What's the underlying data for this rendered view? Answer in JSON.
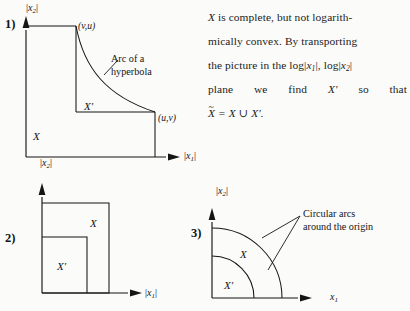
{
  "figure": {
    "caption_text": {
      "lines": [
        "X is complete, but not logarith-",
        "mically convex. By transporting",
        "the picture in the log|x1|, log|x2|",
        "plane we find X' so that",
        "X~ = X ∪ X'."
      ],
      "line1_pre": "X",
      "line1_post": " is complete, but not logarith-",
      "line2": "mically convex. By transporting",
      "line3_a": "the picture in the log|",
      "line3_x1": "x",
      "line3_x1sub": "1",
      "line3_b": "|, log|",
      "line3_x2": "x",
      "line3_x2sub": "2",
      "line3_c": "|",
      "line4_words": [
        "plane",
        "we",
        "find",
        "X′",
        "so",
        "that"
      ],
      "line5_xtilde": "X",
      "line5_rest": " = X ∪ X′."
    },
    "panels": [
      {
        "number": "1)",
        "y_axis_label_abs_open": "|",
        "y_axis_label_var": "x",
        "y_axis_label_sub": "2",
        "y_axis_label_abs_close": "|",
        "x_axis_label_var": "x",
        "x_axis_label_sub": "1",
        "set_outer": "X",
        "set_inner": "X′",
        "coord_top": "(v,u)",
        "coord_right": "(u,v)",
        "annotation_line1": "Arc of a",
        "annotation_line2": "hyperbola"
      },
      {
        "number": "2)",
        "y_axis_label_var": "x",
        "y_axis_label_sub": "2",
        "x_axis_label_var": "x",
        "x_axis_label_sub": "1",
        "set_outer": "X",
        "set_inner": "X′"
      },
      {
        "number": "3)",
        "y_axis_label_var": "x",
        "y_axis_label_sub": "2",
        "x_axis_label_var": "x",
        "x_axis_label_sub": "1",
        "set_outer": "X",
        "set_inner": "X′",
        "annotation_line1": "Circular arcs",
        "annotation_line2": "around the origin"
      }
    ]
  },
  "colors": {
    "ink": "#151515",
    "paper": "#fbfbfa"
  }
}
